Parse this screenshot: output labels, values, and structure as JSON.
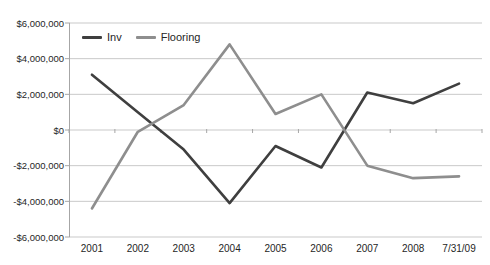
{
  "chart_data": {
    "type": "line",
    "title": "",
    "xlabel": "",
    "ylabel": "",
    "categories": [
      "2001",
      "2002",
      "2003",
      "2004",
      "2005",
      "2006",
      "2007",
      "2008",
      "7/31/09"
    ],
    "series": [
      {
        "name": "Inv",
        "color": "#3f3f3f",
        "values": [
          3100000,
          1000000,
          -1100000,
          -4100000,
          -900000,
          -2100000,
          2100000,
          1500000,
          2600000
        ]
      },
      {
        "name": "Flooring",
        "color": "#8e8e8e",
        "values": [
          -4400000,
          -100000,
          1400000,
          4800000,
          900000,
          2000000,
          -2000000,
          -2700000,
          -2600000
        ]
      }
    ],
    "ylim": [
      -6000000,
      6000000
    ],
    "y_ticks": [
      {
        "value": 6000000,
        "label": "$6,000,000"
      },
      {
        "value": 4000000,
        "label": "$4,000,000"
      },
      {
        "value": 2000000,
        "label": "$2,000,000"
      },
      {
        "value": 0,
        "label": "$0"
      },
      {
        "value": -2000000,
        "label": "-$2,000,000"
      },
      {
        "value": -4000000,
        "label": "-$4,000,000"
      },
      {
        "value": -6000000,
        "label": "-$6,000,000"
      }
    ],
    "grid": "horizontal",
    "legend_position": "top-left-inside"
  },
  "style": {
    "gridline_color": "#c9c9c9",
    "axis_color": "#a6a6a6",
    "tick_color": "#a6a6a6",
    "label_color": "#262626",
    "background": "#ffffff"
  }
}
